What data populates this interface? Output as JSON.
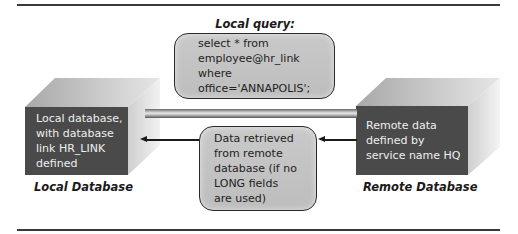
{
  "diagram": {
    "query_caption": "Local query:",
    "query_lines": [
      "select * from",
      "employee@hr_link",
      "where",
      "office='ANNAPOLIS';"
    ],
    "local_db": {
      "front_lines": [
        "Local database,",
        "with database",
        "link HR_LINK",
        "defined"
      ],
      "label": "Local Database"
    },
    "remote_db": {
      "front_lines": [
        "Remote data",
        "defined by",
        "service name HQ"
      ],
      "label": "Remote Database"
    },
    "result_lines": [
      "Data retrieved",
      "from remote",
      "database (if no",
      "LONG fields",
      "are used)"
    ],
    "colors": {
      "cube_front": "#4a4a4a",
      "cube_top": "#b8b8b8",
      "cube_side": "#d4d4d4",
      "bubble_fill": "#c4c4c4",
      "rule": "#3a3a3a"
    }
  }
}
